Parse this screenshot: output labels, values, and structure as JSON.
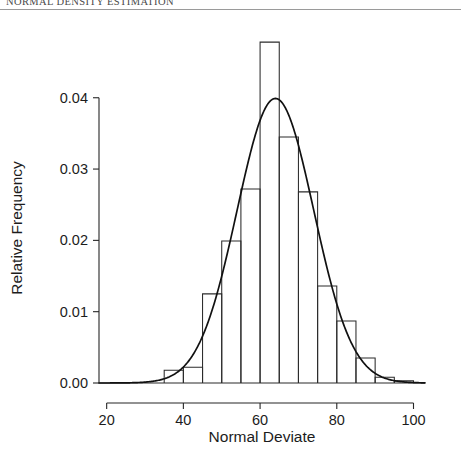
{
  "running_head": "NORMAL DENSITY ESTIMATION",
  "figure": {
    "y_axis_title": "Relative Frequency",
    "x_axis_title": "Normal Deviate"
  },
  "chart_data": {
    "type": "bar",
    "title": "",
    "subtitle": "",
    "xlabel": "Normal Deviate",
    "ylabel": "Relative Frequency",
    "xlim": [
      18,
      103
    ],
    "ylim": [
      0.0,
      0.0495
    ],
    "xticks": [
      20,
      40,
      60,
      80,
      100
    ],
    "xtick_labels": [
      "20",
      "40",
      "60",
      "80",
      "100"
    ],
    "yticks": [
      0.0,
      0.01,
      0.02,
      0.03,
      0.04
    ],
    "ytick_labels": [
      "0.00",
      "0.01",
      "0.02",
      "0.03",
      "0.04"
    ],
    "grid": false,
    "legend": "none",
    "bin_width": 5,
    "bin_edges": [
      30,
      35,
      40,
      45,
      50,
      55,
      60,
      65,
      70,
      75,
      80,
      85,
      90,
      95,
      100
    ],
    "categories": [
      "30-35",
      "35-40",
      "40-45",
      "45-50",
      "50-55",
      "55-60",
      "60-65",
      "65-70",
      "70-75",
      "75-80",
      "80-85",
      "85-90",
      "90-95",
      "95-100"
    ],
    "bin_centers": [
      32.5,
      37.5,
      42.5,
      47.5,
      52.5,
      57.5,
      62.5,
      67.5,
      72.5,
      77.5,
      82.5,
      87.5,
      92.5,
      97.5
    ],
    "values": [
      0.0,
      0.0018,
      0.0022,
      0.0125,
      0.0199,
      0.0272,
      0.0478,
      0.0345,
      0.0268,
      0.0136,
      0.0087,
      0.0035,
      0.0008,
      0.0003
    ],
    "series": [
      {
        "name": "Relative frequency histogram",
        "type": "bar",
        "values": [
          0.0,
          0.0018,
          0.0022,
          0.0125,
          0.0199,
          0.0272,
          0.0478,
          0.0345,
          0.0268,
          0.0136,
          0.0087,
          0.0035,
          0.0008,
          0.0003
        ]
      },
      {
        "name": "Fitted normal density",
        "type": "line",
        "mean": 64.0,
        "sd": 10.0,
        "peak_value": 0.0399,
        "x_start": 18,
        "x_end": 103
      }
    ],
    "annotations": []
  }
}
